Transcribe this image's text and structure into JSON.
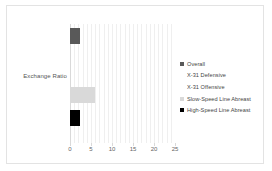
{
  "chart_data": {
    "type": "bar",
    "orientation": "horizontal",
    "title": "",
    "xlabel": "",
    "ylabel": "",
    "categories": [
      "Exchange Ratio"
    ],
    "xlim": [
      0,
      25
    ],
    "xticks": [
      0,
      5,
      10,
      15,
      20,
      25
    ],
    "xtick_labels": [
      "0",
      "5",
      "10",
      "15",
      "20",
      "25"
    ],
    "grid": true,
    "grid_axis": "x",
    "legend_position": "right",
    "series": [
      {
        "name": "Overall",
        "values": [
          2.4
        ],
        "color": "#595959"
      },
      {
        "name": "X-31 Defensive",
        "values": [
          0.1
        ],
        "color": "#1a1a1a"
      },
      {
        "name": "X-31 Offensive",
        "values": [
          22.6
        ],
        "color": "#a6a6a6"
      },
      {
        "name": "Slow-Speed Line Abreast",
        "values": [
          6.0
        ],
        "color": "#d9d9d9"
      },
      {
        "name": "High-Speed Line Abreast",
        "values": [
          2.4
        ],
        "color": "#000000"
      }
    ]
  },
  "axis": {
    "tick_0": "0",
    "tick_1": "5",
    "tick_2": "10",
    "tick_3": "15",
    "tick_4": "20",
    "tick_5": "25"
  },
  "category": {
    "label_0": "Exchange Ratio"
  },
  "legend": {
    "item_0": "Overall",
    "item_1": "X-31 Defensive",
    "item_2": "X-31 Offensive",
    "item_3": "Slow-Speed Line Abreast",
    "item_4": "High-Speed Line Abreast"
  }
}
